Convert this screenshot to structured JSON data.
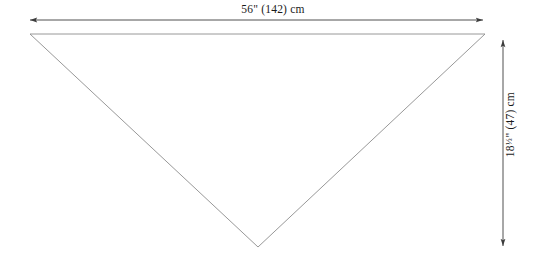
{
  "diagram": {
    "background_color": "#ffffff",
    "shape": {
      "name": "inverted-triangle",
      "type": "triangle",
      "orientation": "point-down",
      "outline_color": "#8c8c8c",
      "fill_color": "none",
      "stroke_width": 0.9,
      "vertices": [
        {
          "label": "top-left",
          "x": 30,
          "y": 34
        },
        {
          "label": "top-right",
          "x": 485,
          "y": 34
        },
        {
          "label": "bottom-apex",
          "x": 258,
          "y": 247
        }
      ]
    },
    "dimensions": {
      "width": {
        "name": "width-dimension",
        "label": "56\" (142) cm",
        "inches": "56",
        "inches_symbol": "\"",
        "centimeters": "142",
        "unit": "cm",
        "orientation": "horizontal",
        "line_color": "#3c3c3c",
        "line": {
          "x1": 28,
          "y1": 20,
          "x2": 485,
          "y2": 20
        },
        "arrowheads": [
          "start",
          "end"
        ]
      },
      "height": {
        "name": "height-dimension",
        "label_prefix": "18",
        "label_fraction": "1/2",
        "label_suffix": "\" (47) cm",
        "label_full": "18 1/2\" (47) cm",
        "inches": "18 1/2",
        "centimeters": "47",
        "unit": "cm",
        "orientation": "vertical",
        "rotation_degrees": -90,
        "line_color": "#3c3c3c",
        "line": {
          "x1": 503,
          "y1": 38,
          "x2": 503,
          "y2": 248
        },
        "arrowheads": [
          "start",
          "end"
        ]
      }
    }
  }
}
